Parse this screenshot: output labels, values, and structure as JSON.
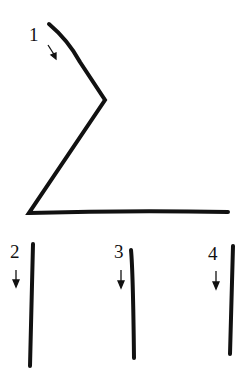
{
  "diagram": {
    "type": "stroke-order",
    "strokes": [
      {
        "number": "1",
        "label_pos": [
          29,
          25
        ],
        "arrow": "down-right",
        "description": "diagonal down-right, then down-left, then horizontal right"
      },
      {
        "number": "2",
        "label_pos": [
          10,
          242
        ],
        "arrow": "down",
        "description": "vertical stroke"
      },
      {
        "number": "3",
        "label_pos": [
          114,
          242
        ],
        "arrow": "down",
        "description": "vertical stroke"
      },
      {
        "number": "4",
        "label_pos": [
          208,
          244
        ],
        "arrow": "down",
        "description": "vertical stroke"
      }
    ],
    "colors": {
      "ink": "#111111",
      "background": "#ffffff"
    }
  }
}
